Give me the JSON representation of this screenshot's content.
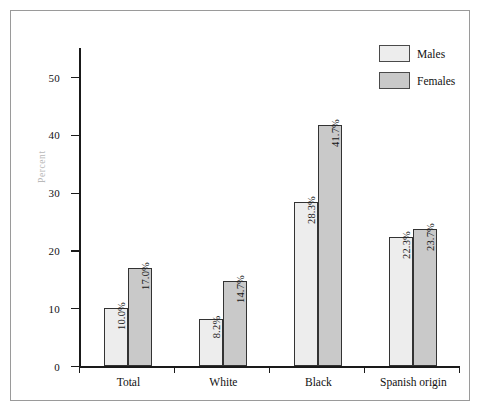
{
  "chart_data": {
    "type": "bar",
    "title": "",
    "subtitle": "",
    "xlabel": "",
    "ylabel": "Percent",
    "ylim": [
      0,
      55
    ],
    "grid": false,
    "legend_position": "top-right",
    "categories": [
      "Total",
      "White",
      "Black",
      "Spanish origin"
    ],
    "y_ticks": [
      0,
      10,
      20,
      30,
      40,
      50
    ],
    "y_tick_labels": [
      "0",
      "10",
      "20",
      "30",
      "40",
      "50"
    ],
    "series": [
      {
        "name": "Males",
        "color": "#ededed",
        "values": [
          10.0,
          8.2,
          28.3,
          22.3
        ],
        "data_labels": [
          "10.0%",
          "8.2%",
          "28.3%",
          "22.3%"
        ]
      },
      {
        "name": "Females",
        "color": "#c9c9c9",
        "values": [
          17.0,
          14.7,
          41.7,
          23.7
        ],
        "data_labels": [
          "17.0%",
          "14.7%",
          "41.7%",
          "23.7%"
        ]
      }
    ]
  },
  "legend": {
    "items": [
      {
        "label": "Males",
        "color": "#ededed"
      },
      {
        "label": "Females",
        "color": "#c9c9c9"
      }
    ]
  },
  "axis": {
    "y_title": "Percent"
  },
  "colors": {
    "frame": "#9a9a9a",
    "axis": "#1a1a1a",
    "males": "#ededed",
    "females": "#c9c9c9",
    "bar_outline": "#333333",
    "axis_title": "#b9b9b9"
  }
}
